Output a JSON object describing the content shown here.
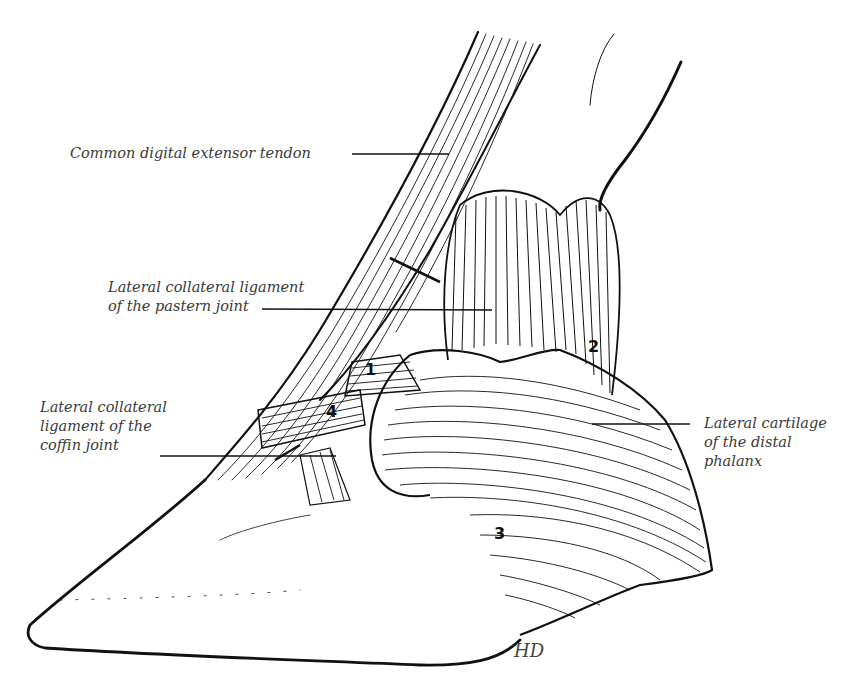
{
  "figure": {
    "labels": [
      {
        "id": "common-digital-extensor-tendon",
        "text": "Common digital extensor tendon"
      },
      {
        "id": "lateral-collateral-ligament-pastern",
        "text": "Lateral collateral ligament\nof the pastern joint"
      },
      {
        "id": "lateral-collateral-ligament-coffin",
        "text": "Lateral collateral\nligament of the\ncoffin joint"
      },
      {
        "id": "lateral-cartilage-distal-phalanx",
        "text": "Lateral cartilage\nof the distal\nphalanx"
      }
    ],
    "numbers": [
      {
        "id": "1",
        "text": "1"
      },
      {
        "id": "2",
        "text": "2"
      },
      {
        "id": "3",
        "text": "3"
      },
      {
        "id": "4",
        "text": "4"
      }
    ],
    "signature": "HD"
  }
}
